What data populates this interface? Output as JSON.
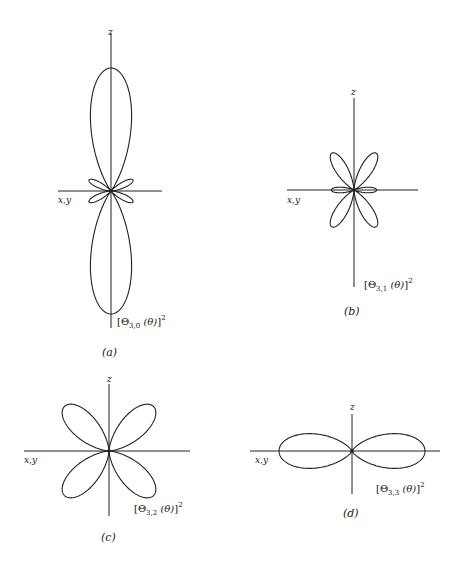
{
  "figure": {
    "stroke_color": "#222222",
    "background": "#ffffff",
    "panels": [
      {
        "id": "a",
        "caption": "(a)",
        "function_label": {
          "symbol": "Θ",
          "subscript": "3,0",
          "arg": "(θ)",
          "power": "2"
        },
        "z_label": "z",
        "xy_label": "x,y",
        "center": [
          111,
          191
        ],
        "lobe_scale": 123,
        "formula": "(5cos^3θ - 3cosθ)^2",
        "z_axis": [
          33,
          328
        ],
        "xy_axis": [
          58,
          162
        ],
        "positions": {
          "z": [
            108,
            28
          ],
          "xy": [
            58,
            196
          ],
          "fn": [
            117,
            315
          ],
          "cap": [
            102,
            347
          ]
        }
      },
      {
        "id": "b",
        "caption": "(b)",
        "function_label": {
          "symbol": "Θ",
          "subscript": "3,1",
          "arg": "(θ)",
          "power": "2"
        },
        "z_label": "z",
        "xy_label": "x,y",
        "center": [
          354,
          190
        ],
        "lobe_scale": 43,
        "formula": "sin^2θ (5cos^2θ - 1)^2",
        "z_axis": [
          98,
          287
        ],
        "xy_axis": [
          287,
          418
        ],
        "positions": {
          "z": [
            351,
            88
          ],
          "xy": [
            287,
            196
          ],
          "fn": [
            364,
            278
          ],
          "cap": [
            344,
            306
          ]
        }
      },
      {
        "id": "c",
        "caption": "(c)",
        "function_label": {
          "symbol": "Θ",
          "subscript": "3,2",
          "arg": "(θ)",
          "power": "2"
        },
        "z_label": "z",
        "xy_label": "x,y",
        "center": [
          109,
          451
        ],
        "lobe_scale": 63,
        "formula": "sin^2θ cos^2θ",
        "z_axis": [
          384,
          516
        ],
        "xy_axis": [
          24,
          190
        ],
        "positions": {
          "z": [
            107,
            375
          ],
          "xy": [
            24,
            456
          ],
          "fn": [
            134,
            502
          ],
          "cap": [
            101,
            532
          ]
        }
      },
      {
        "id": "d",
        "caption": "(d)",
        "function_label": {
          "symbol": "Θ",
          "subscript": "3,3",
          "arg": "(θ)",
          "power": "2"
        },
        "z_label": "z",
        "xy_label": "x,y",
        "center": [
          352,
          451
        ],
        "lobe_scale": 73,
        "formula": "sin^6θ",
        "z_axis": [
          414,
          494
        ],
        "xy_axis": [
          250,
          440
        ],
        "positions": {
          "z": [
            350,
            403
          ],
          "xy": [
            255,
            456
          ],
          "fn": [
            376,
            482
          ],
          "cap": [
            343,
            508
          ]
        }
      }
    ]
  }
}
